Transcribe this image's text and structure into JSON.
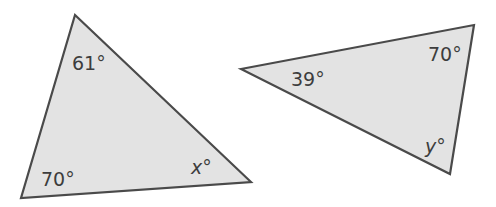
{
  "colors": {
    "fill": "#e3e3e3",
    "stroke": "#4a4a4a",
    "text": "#3d3d3d",
    "background": "#ffffff"
  },
  "triangles": [
    {
      "name": "left-triangle",
      "vertices": [
        [
          75,
          15
        ],
        [
          21,
          198
        ],
        [
          251,
          182
        ]
      ],
      "angles": [
        {
          "vertex": "top",
          "label": "61°"
        },
        {
          "vertex": "bottom-left",
          "label": "70°"
        },
        {
          "vertex": "right",
          "label": "x°",
          "variable": "x"
        }
      ]
    },
    {
      "name": "right-triangle",
      "vertices": [
        [
          241,
          69
        ],
        [
          474,
          25
        ],
        [
          450,
          174
        ]
      ],
      "angles": [
        {
          "vertex": "left",
          "label": "39°"
        },
        {
          "vertex": "top-right",
          "label": "70°"
        },
        {
          "vertex": "bottom",
          "label": "y°",
          "variable": "y"
        }
      ]
    }
  ]
}
